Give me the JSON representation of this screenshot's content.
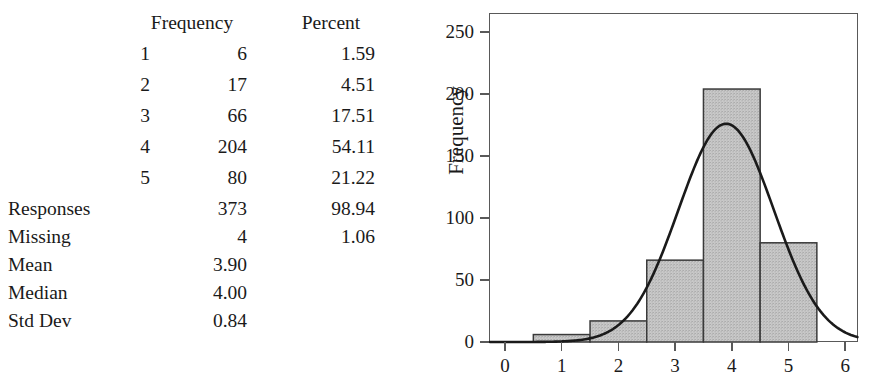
{
  "table": {
    "columns": [
      "",
      "Frequency",
      "Percent"
    ],
    "header": {
      "level": "",
      "frequency": "Frequency",
      "percent": "Percent"
    },
    "level_rows": [
      {
        "level": "1",
        "frequency": "6",
        "percent": "1.59"
      },
      {
        "level": "2",
        "frequency": "17",
        "percent": "4.51"
      },
      {
        "level": "3",
        "frequency": "66",
        "percent": "17.51"
      },
      {
        "level": "4",
        "frequency": "204",
        "percent": "54.11"
      },
      {
        "level": "5",
        "frequency": "80",
        "percent": "21.22"
      }
    ],
    "summary_rows": [
      {
        "label": "Responses",
        "frequency": "373",
        "percent": "98.94"
      },
      {
        "label": "Missing",
        "frequency": "4",
        "percent": "1.06"
      },
      {
        "label": "Mean",
        "frequency": "3.90",
        "percent": ""
      },
      {
        "label": "Median",
        "frequency": "4.00",
        "percent": ""
      },
      {
        "label": "Std Dev",
        "frequency": "0.84",
        "percent": ""
      }
    ]
  },
  "chart_data": {
    "type": "bar",
    "title": "",
    "xlabel": "",
    "ylabel": "Frequency",
    "categories": [
      "1",
      "2",
      "3",
      "4",
      "5"
    ],
    "values": [
      6,
      17,
      66,
      204,
      80
    ],
    "bin_edges": [
      0.5,
      1.5,
      2.5,
      3.5,
      4.5,
      5.5
    ],
    "xlim": [
      -0.35,
      6.5
    ],
    "ylim": [
      0,
      265
    ],
    "xticks": [
      "0",
      "1",
      "2",
      "3",
      "4",
      "5",
      "6"
    ],
    "xtick_values": [
      0,
      1,
      2,
      3,
      4,
      5,
      6
    ],
    "yticks": [
      "0",
      "50",
      "100",
      "150",
      "200",
      "250"
    ],
    "ytick_values": [
      0,
      50,
      100,
      150,
      200,
      250
    ],
    "grid": false,
    "legend": false,
    "overlay": {
      "type": "line",
      "name": "normal-curve",
      "mean": 3.9,
      "std_dev": 0.84,
      "peak_value": 176
    },
    "colors": {
      "bar_fill": "#c9c9c9",
      "bar_edge": "#3a3a3a",
      "curve": "#1a1a1a",
      "axis": "#595959",
      "background": "#ffffff"
    }
  }
}
